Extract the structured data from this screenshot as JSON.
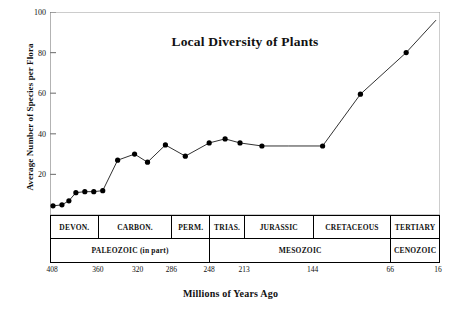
{
  "chart_data": {
    "type": "line",
    "title": "Local Diversity of Plants",
    "xlabel": "Millions of Years Ago",
    "ylabel": "Average Number of Species per Flora",
    "xlim": [
      408,
      16
    ],
    "ylim": [
      0,
      100
    ],
    "x_inverted": true,
    "grid": false,
    "legend": "none",
    "yticks": [
      20,
      40,
      60,
      80,
      100
    ],
    "xticks": [
      408,
      360,
      320,
      286,
      248,
      213,
      144,
      66,
      16
    ],
    "marker": "filled-circle",
    "series": [
      {
        "name": "Average number of species per flora",
        "x": [
          405,
          396,
          389,
          382,
          373,
          364,
          355,
          340,
          323,
          310,
          292,
          272,
          248,
          232,
          217,
          195,
          168,
          134,
          96,
          50,
          20
        ],
        "y": [
          4.5,
          5.0,
          7.0,
          11.0,
          11.5,
          11.5,
          12.0,
          27.0,
          30.0,
          26.0,
          34.5,
          29.0,
          35.5,
          37.5,
          35.5,
          34.0,
          34.0,
          34.0,
          59.5,
          80.0,
          96.0
        ],
        "points_marked": [
          true,
          true,
          true,
          true,
          true,
          true,
          true,
          true,
          true,
          true,
          true,
          true,
          true,
          true,
          true,
          true,
          false,
          true,
          true,
          true,
          false
        ]
      }
    ],
    "bands": {
      "period_row": [
        {
          "label": "DEVON.",
          "start": 408,
          "end": 360
        },
        {
          "label": "CARBON.",
          "start": 360,
          "end": 286
        },
        {
          "label": "PERM.",
          "start": 286,
          "end": 248
        },
        {
          "label": "TRIAS.",
          "start": 248,
          "end": 213
        },
        {
          "label": "JURASSIC",
          "start": 213,
          "end": 144
        },
        {
          "label": "CRETACEOUS",
          "start": 144,
          "end": 66
        },
        {
          "label": "TERTIARY",
          "start": 66,
          "end": 16
        }
      ],
      "era_row": [
        {
          "label": "PALEOZOIC (in part)",
          "start": 408,
          "end": 248
        },
        {
          "label": "MESOZOIC",
          "start": 248,
          "end": 66
        },
        {
          "label": "CENOZOIC",
          "start": 66,
          "end": 16
        }
      ]
    },
    "colors": {
      "line": "#1a1a1a",
      "marker": "#000000",
      "axis": "#808080",
      "frame": "#9a9a9a",
      "text": "#111111",
      "background": "#ffffff"
    }
  }
}
